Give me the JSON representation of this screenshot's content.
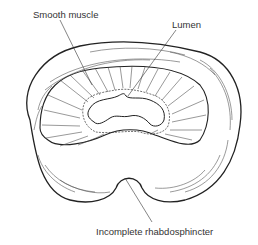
{
  "figure": {
    "labels": {
      "smooth_muscle": "Smooth muscle",
      "lumen": "Lumen",
      "rhabdosphincter": "Incomplete rhabdosphincter"
    },
    "colors": {
      "ink": "#222222",
      "background": "#ffffff"
    }
  }
}
